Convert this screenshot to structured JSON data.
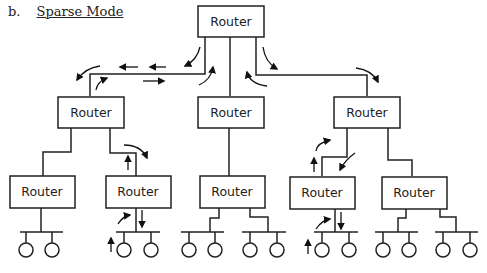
{
  "heading": {
    "letter": "b.",
    "title": "Sparse Mode"
  },
  "router_label": "Router",
  "routers": [
    {
      "id": "top",
      "label": "Router"
    },
    {
      "id": "mid-left",
      "label": "Router"
    },
    {
      "id": "mid-center",
      "label": "Router"
    },
    {
      "id": "mid-right",
      "label": "Router"
    },
    {
      "id": "bottom-1",
      "label": "Router"
    },
    {
      "id": "bottom-2",
      "label": "Router"
    },
    {
      "id": "bottom-3",
      "label": "Router"
    },
    {
      "id": "bottom-4",
      "label": "Router"
    },
    {
      "id": "bottom-5",
      "label": "Router"
    }
  ],
  "lan_segments": 7,
  "hosts_per_lan": 2,
  "colors": {
    "stroke": "#222222",
    "background": "#ffffff"
  }
}
